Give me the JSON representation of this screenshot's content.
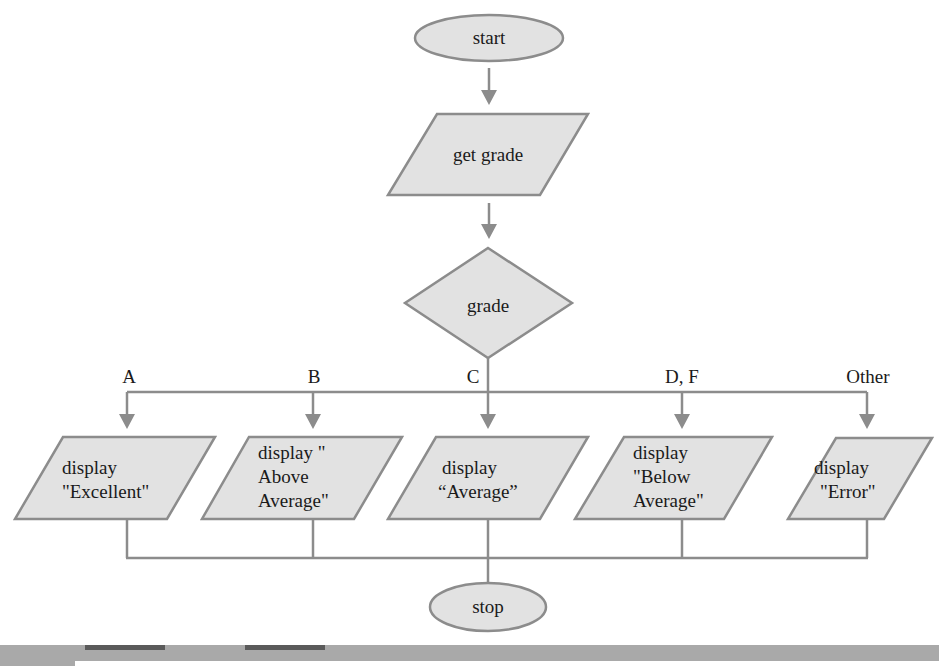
{
  "diagram": {
    "type": "flowchart",
    "colors": {
      "shape_fill": "#e2e2e2",
      "stroke": "#8c8c8c",
      "text": "#1a1a1a",
      "footer": "#a9a9a9",
      "footer_accent": "#5a5a5a"
    },
    "start": {
      "label": "start"
    },
    "input": {
      "label": "get grade"
    },
    "decision": {
      "label": "grade"
    },
    "branches": [
      {
        "case": "A",
        "lines": [
          "display",
          "\"Excellent\""
        ]
      },
      {
        "case": "B",
        "lines": [
          "display \"",
          "Above",
          "Average\""
        ]
      },
      {
        "case": "C",
        "lines": [
          "display",
          "“Average”"
        ]
      },
      {
        "case": "D, F",
        "lines": [
          "display",
          "\"Below",
          "Average\""
        ]
      },
      {
        "case": "Other",
        "lines": [
          "display",
          "\"Error\""
        ]
      }
    ],
    "stop": {
      "label": "stop"
    }
  }
}
